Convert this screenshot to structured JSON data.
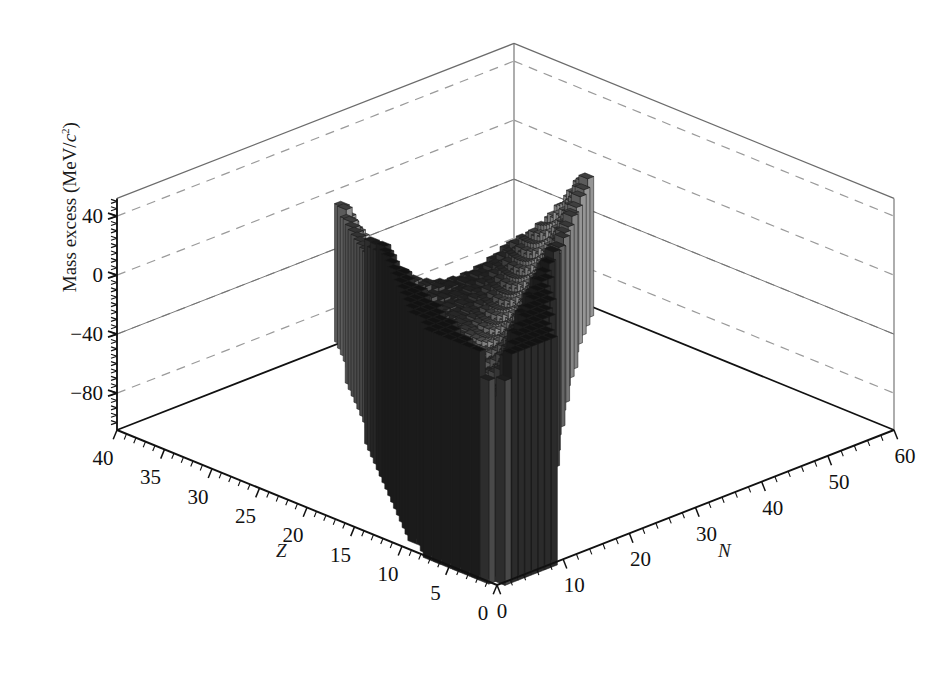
{
  "chart_data": {
    "type": "bar",
    "render": "3d-bar-surface",
    "title": "",
    "subtitle": "",
    "xlabel": "N",
    "ylabel": "Z",
    "zlabel": "Mass excess (MeV/c²)",
    "zlabel_parts": {
      "lead": "Mass excess (MeV/",
      "italic": "c",
      "sup": "2",
      "tail": ")"
    },
    "grid": true,
    "legend": "none",
    "axes": {
      "N": {
        "label": "N",
        "italic": true,
        "min": 0,
        "max": 60,
        "tick_labels": [
          "0",
          "10",
          "20",
          "30",
          "40",
          "50",
          "60"
        ],
        "tick_values": [
          0,
          10,
          20,
          30,
          40,
          50,
          60
        ],
        "minor_step": 2
      },
      "Z": {
        "label": "Z",
        "italic": true,
        "min": 0,
        "max": 40,
        "tick_labels": [
          "0",
          "5",
          "10",
          "15",
          "20",
          "25",
          "30",
          "35",
          "40"
        ],
        "tick_values": [
          0,
          5,
          10,
          15,
          20,
          25,
          30,
          35,
          40
        ],
        "minor_step": 1
      },
      "MassExcess": {
        "label": "Mass excess (MeV/c^2)",
        "min": -105,
        "max": 52,
        "tick_labels": [
          "40",
          "0",
          "−40",
          "−80"
        ],
        "tick_values": [
          40,
          0,
          -40,
          -80
        ],
        "minor_step": 5,
        "gridline_values": [
          40,
          0,
          -40,
          -80
        ]
      }
    },
    "colors": {
      "axis_line": "#111111",
      "box_line": "#6b6b6b",
      "gridline_dashed": "#9a9a9a",
      "background": "#ffffff",
      "bar_edge": "#1b1b1b",
      "colormap": "grayscale-valley",
      "colormap_low": "#2a2a2a",
      "colormap_mid": "#e8e8e8",
      "colormap_high": "#303030"
    },
    "valley": {
      "note": "bar height = mass excess; minimum near N~Z stability line",
      "approx_min_value": -90,
      "approx_max_value": 50
    },
    "series": [
      {
        "name": "Mass excess",
        "unit": "MeV/c^2"
      }
    ],
    "sample_points": [
      {
        "N": 0,
        "Z": 1,
        "value": 7.3
      },
      {
        "N": 1,
        "Z": 0,
        "value": 8.1
      },
      {
        "N": 2,
        "Z": 2,
        "value": 2.4
      },
      {
        "N": 6,
        "Z": 6,
        "value": 0.0
      },
      {
        "N": 8,
        "Z": 8,
        "value": -4.7
      },
      {
        "N": 12,
        "Z": 12,
        "value": -13.9
      },
      {
        "N": 14,
        "Z": 14,
        "value": -21.5
      },
      {
        "N": 16,
        "Z": 16,
        "value": -26.0
      },
      {
        "N": 20,
        "Z": 20,
        "value": -34.8
      },
      {
        "N": 22,
        "Z": 20,
        "value": -42.3
      },
      {
        "N": 26,
        "Z": 24,
        "value": -55.4
      },
      {
        "N": 28,
        "Z": 26,
        "value": -62.2
      },
      {
        "N": 30,
        "Z": 26,
        "value": -60.6
      },
      {
        "N": 32,
        "Z": 28,
        "value": -66.7
      },
      {
        "N": 34,
        "Z": 30,
        "value": -68.9
      },
      {
        "N": 38,
        "Z": 32,
        "value": -70.6
      },
      {
        "N": 42,
        "Z": 34,
        "value": -73.0
      },
      {
        "N": 46,
        "Z": 36,
        "value": -77.8
      },
      {
        "N": 50,
        "Z": 38,
        "value": -81.5
      },
      {
        "N": 54,
        "Z": 40,
        "value": -86.0
      },
      {
        "N": 58,
        "Z": 40,
        "value": -83.4
      }
    ]
  },
  "figure": {
    "kind": "3d-bar-plot",
    "projection": "isometric",
    "geometry": {
      "origin_px": [
        497,
        585
      ],
      "left_corner_px": [
        117,
        430
      ],
      "right_corner_px": [
        894,
        430
      ],
      "apex_px": [
        513,
        32
      ],
      "z_axis_top_px": [
        117,
        215
      ],
      "unit_height_px": 1.475
    }
  }
}
